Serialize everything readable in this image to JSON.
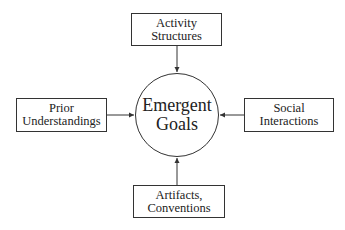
{
  "diagram": {
    "center": {
      "line1": "Emergent",
      "line2": "Goals"
    },
    "top": {
      "line1": "Activity",
      "line2": "Structures"
    },
    "left": {
      "line1": "Prior",
      "line2": "Understandings"
    },
    "right": {
      "line1": "Social",
      "line2": "Interactions"
    },
    "bottom": {
      "line1": "Artifacts,",
      "line2": "Conventions"
    }
  }
}
